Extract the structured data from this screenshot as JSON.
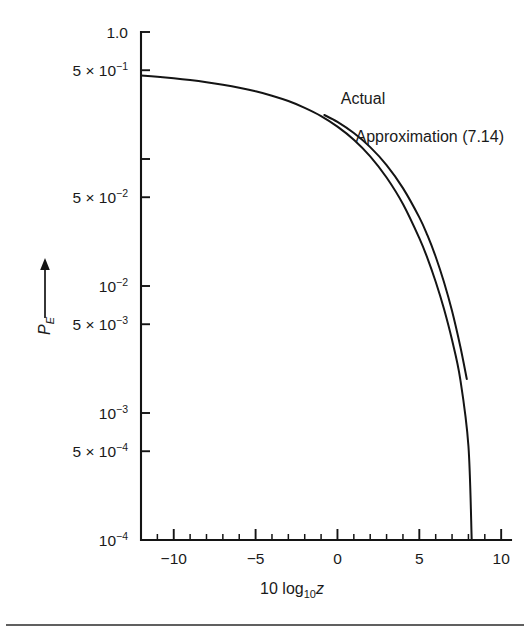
{
  "figure": {
    "background_color": "#ffffff",
    "ink_color": "#141414",
    "has_footer_rule": true
  },
  "chart_data": {
    "type": "line",
    "title": "",
    "subtitle": "",
    "xlabel": "10 log10 z",
    "xlabel_parts": {
      "lead": "10 log",
      "sub": "10",
      "var": "z"
    },
    "ylabel": "PE",
    "ylabel_parts": {
      "base": "P",
      "sub": "E"
    },
    "ylabel_has_up_arrow": true,
    "grid": false,
    "legend": "inline-annotations",
    "xscale": "linear",
    "yscale": "log",
    "xlim": [
      -12,
      10.6
    ],
    "ylim": [
      0.0001,
      1.0
    ],
    "x_ticks_major": [
      -10,
      -5,
      0,
      5,
      10
    ],
    "x_tick_labels": [
      "−10",
      "−5",
      "0",
      "5",
      "10"
    ],
    "x_minor_tick_step": 1,
    "y_ticks": [
      {
        "value": 1.0,
        "label": "1.0",
        "mantissa": "",
        "exponent": "",
        "labeled": true
      },
      {
        "value": 0.5,
        "label": "5 × 10⁻¹",
        "mantissa": "5 × 10",
        "exponent": "−1",
        "labeled": true
      },
      {
        "value": 0.1,
        "label": "",
        "mantissa": "",
        "exponent": "",
        "labeled": false
      },
      {
        "value": 0.05,
        "label": "5 × 10⁻²",
        "mantissa": "5 × 10",
        "exponent": "−2",
        "labeled": true
      },
      {
        "value": 0.01,
        "label": "10⁻²",
        "mantissa": "10",
        "exponent": "−2",
        "labeled": true
      },
      {
        "value": 0.005,
        "label": "5 × 10⁻³",
        "mantissa": "5 × 10",
        "exponent": "−3",
        "labeled": true
      },
      {
        "value": 0.001,
        "label": "10⁻³",
        "mantissa": "10",
        "exponent": "−3",
        "labeled": true
      },
      {
        "value": 0.0005,
        "label": "5 × 10⁻⁴",
        "mantissa": "5 × 10",
        "exponent": "−4",
        "labeled": true
      },
      {
        "value": 0.0001,
        "label": "10⁻⁴",
        "mantissa": "10",
        "exponent": "−4",
        "labeled": true
      }
    ],
    "series": [
      {
        "name": "Actual",
        "annotation": "Actual",
        "annotation_x": 0.2,
        "annotation_y": 0.27,
        "x": [
          -12,
          -11,
          -10,
          -9,
          -8,
          -7,
          -6,
          -5,
          -4,
          -3,
          -2,
          -1,
          0,
          1,
          2,
          3,
          4,
          5,
          5.5,
          6,
          6.5,
          7,
          7.5,
          8,
          8.2
        ],
        "y": [
          0.455,
          0.444,
          0.432,
          0.418,
          0.402,
          0.384,
          0.364,
          0.341,
          0.315,
          0.286,
          0.253,
          0.218,
          0.18,
          0.142,
          0.105,
          0.0715,
          0.0442,
          0.0238,
          0.0165,
          0.0108,
          0.00665,
          0.00375,
          0.00185,
          0.00055,
          0.0001
        ]
      },
      {
        "name": "Approximation (7.14)",
        "annotation": "Approximation (7.14)",
        "annotation_x": 1.1,
        "annotation_y": 0.135,
        "x": [
          -0.8,
          0,
          1,
          2,
          3,
          4,
          5,
          5.5,
          6,
          6.5,
          7,
          7.5,
          7.9
        ],
        "y": [
          0.222,
          0.196,
          0.16,
          0.124,
          0.0895,
          0.059,
          0.0347,
          0.025,
          0.017,
          0.0108,
          0.00635,
          0.00335,
          0.00185
        ]
      }
    ]
  },
  "annotations": {
    "actual_label": "Actual",
    "approximation_label": "Approximation (7.14)"
  }
}
